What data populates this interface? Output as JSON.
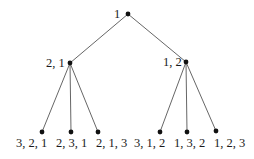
{
  "diagram": {
    "type": "tree",
    "nodes": [
      {
        "id": "root",
        "label": "1",
        "x": 128,
        "y": 14
      },
      {
        "id": "n21",
        "label": "2, 1",
        "x": 70,
        "y": 63
      },
      {
        "id": "n12",
        "label": "1, 2",
        "x": 186,
        "y": 62
      },
      {
        "id": "l321",
        "label": "3, 2, 1",
        "x": 42,
        "y": 132
      },
      {
        "id": "l231",
        "label": "2, 3, 1",
        "x": 71,
        "y": 132
      },
      {
        "id": "l213",
        "label": "2, 1, 3",
        "x": 98,
        "y": 132
      },
      {
        "id": "l312",
        "label": "3, 1, 2",
        "x": 160,
        "y": 132
      },
      {
        "id": "l132",
        "label": "1, 3, 2",
        "x": 187,
        "y": 132
      },
      {
        "id": "l123",
        "label": "1, 2, 3",
        "x": 216,
        "y": 131
      }
    ],
    "edges": [
      [
        "root",
        "n21"
      ],
      [
        "root",
        "n12"
      ],
      [
        "n21",
        "l321"
      ],
      [
        "n21",
        "l231"
      ],
      [
        "n21",
        "l213"
      ],
      [
        "n12",
        "l312"
      ],
      [
        "n12",
        "l132"
      ],
      [
        "n12",
        "l123"
      ]
    ]
  }
}
